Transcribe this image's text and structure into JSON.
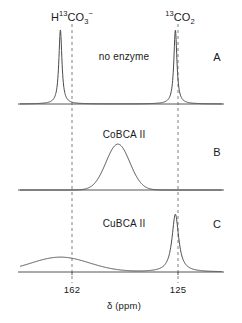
{
  "figure": {
    "axis_title": "δ (ppm)",
    "background_color": "#ffffff",
    "trace_color": "#4a4a4a",
    "baseline_color": "#555555",
    "guide_color": "#808080",
    "text_color": "#1a1a1a"
  },
  "species_labels": [
    {
      "id": "bicarbonate",
      "pre": "H",
      "sup": "13",
      "mid": "CO",
      "sub": "3",
      "charge": "−",
      "x": 72,
      "y": 12
    },
    {
      "id": "carbon-dioxide",
      "pre": "",
      "sup": "13",
      "mid": "CO",
      "sub": "2",
      "charge": "",
      "x": 180,
      "y": 12
    }
  ],
  "panels": [
    {
      "id": "panel-a",
      "letter": "A",
      "condition": "no enzyme",
      "condition_x": 124,
      "condition_y": 52,
      "letter_x": 217,
      "letter_y": 52,
      "baseline_y": 104
    },
    {
      "id": "panel-b",
      "letter": "B",
      "condition": "CoBCA II",
      "condition_x": 124,
      "condition_y": 130,
      "letter_x": 217,
      "letter_y": 147,
      "baseline_y": 190
    },
    {
      "id": "panel-c",
      "letter": "C",
      "condition": "CuBCA II",
      "condition_x": 124,
      "condition_y": 219,
      "letter_x": 217,
      "letter_y": 219,
      "baseline_y": 272
    }
  ],
  "guides": [
    {
      "id": "guide-162",
      "x": 72,
      "y_top": 24,
      "y_bottom": 283
    },
    {
      "id": "guide-125",
      "x": 178,
      "y_top": 24,
      "y_bottom": 283
    }
  ],
  "ticks": [
    {
      "label": "162",
      "x": 72,
      "y": 285
    },
    {
      "label": "125",
      "x": 178,
      "y": 285
    }
  ],
  "axis_title_pos": {
    "x": 124,
    "y": 301
  },
  "chart_data": {
    "type": "line",
    "xlabel": "δ (ppm)",
    "ylabel": "",
    "xlim": [
      175,
      110
    ],
    "grid": false,
    "legend": "none",
    "x_ticks": [
      162,
      125
    ],
    "panels": [
      {
        "name": "A",
        "annotation": "no enzyme",
        "peaks": [
          {
            "assignment": "H13CO3-",
            "center_ppm": 162,
            "shape": "lorentzian",
            "relative_height": 1.0,
            "width_ppm": 1.2
          },
          {
            "assignment": "13CO2",
            "center_ppm": 125,
            "shape": "lorentzian",
            "relative_height": 1.0,
            "width_ppm": 1.2
          }
        ]
      },
      {
        "name": "B",
        "annotation": "CoBCA II",
        "peaks": [
          {
            "assignment": "exchange-averaged",
            "center_ppm": 143.5,
            "shape": "gaussian",
            "relative_height": 0.62,
            "width_ppm": 9.0
          }
        ]
      },
      {
        "name": "C",
        "annotation": "CuBCA II",
        "peaks": [
          {
            "assignment": "H13CO3-",
            "center_ppm": 162,
            "shape": "gaussian",
            "relative_height": 0.2,
            "width_ppm": 22.0
          },
          {
            "assignment": "13CO2",
            "center_ppm": 125,
            "shape": "lorentzian",
            "relative_height": 0.78,
            "width_ppm": 2.6
          }
        ]
      }
    ]
  }
}
